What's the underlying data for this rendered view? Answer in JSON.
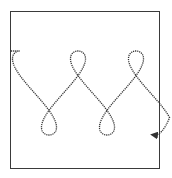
{
  "diagram": {
    "frame": {
      "x": 10,
      "y": 11,
      "width": 150,
      "height": 158,
      "stroke": "#3a3a3a"
    },
    "curve": {
      "type": "looping-figure-eight-chain",
      "style": "dotted",
      "stroke": "#333333",
      "start": [
        11,
        51
      ],
      "end": [
        154,
        135
      ],
      "center_y": 93,
      "half_height": 42,
      "x_start": 20,
      "x_step_per_cycle": 58,
      "loop_width": 14,
      "cycles": 2.35,
      "arrowhead": "end"
    }
  }
}
